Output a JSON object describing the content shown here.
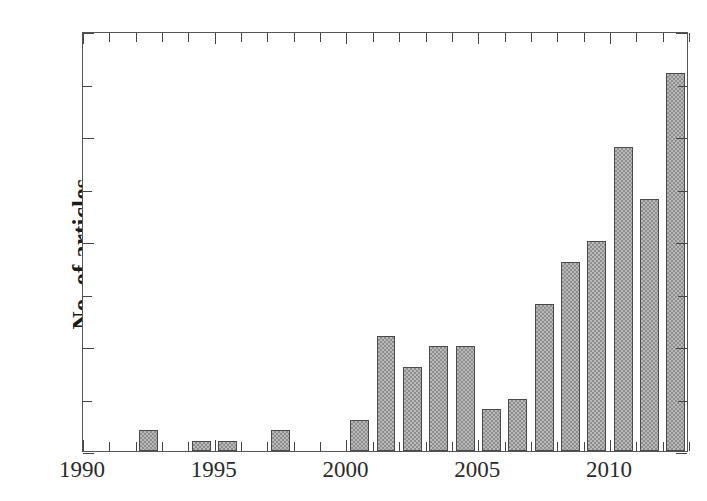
{
  "chart_data": {
    "type": "bar",
    "title": "",
    "xlabel": "",
    "ylabel": "No. of articles",
    "xlim": [
      1990,
      2013
    ],
    "ylim": [
      0,
      40
    ],
    "grid": false,
    "legend": null,
    "y_major_ticks": [
      0,
      10,
      20,
      30,
      40
    ],
    "y_minor_ticks": [
      5,
      15,
      25,
      35
    ],
    "y_tick_labels": [
      "0",
      "10",
      "20",
      "30",
      "40"
    ],
    "x_major_ticks": [
      1990,
      1995,
      2000,
      2005,
      2010
    ],
    "x_tick_labels": [
      "1990",
      "1995",
      "2000",
      "2005",
      "2010"
    ],
    "categories": [
      1990,
      1991,
      1992,
      1993,
      1994,
      1995,
      1996,
      1997,
      1998,
      1999,
      2000,
      2001,
      2002,
      2003,
      2004,
      2005,
      2006,
      2007,
      2008,
      2009,
      2010,
      2011,
      2012
    ],
    "values": [
      0,
      0,
      2,
      0,
      1,
      1,
      0,
      2,
      0,
      0,
      3,
      11,
      8,
      10,
      10,
      4,
      5,
      14,
      18,
      20,
      29,
      24,
      36
    ],
    "bar_face_color": "#b9b9b9",
    "bar_edge_color": "#4a4a4a",
    "axis_color": "#555555",
    "text_color": "#231f20"
  }
}
